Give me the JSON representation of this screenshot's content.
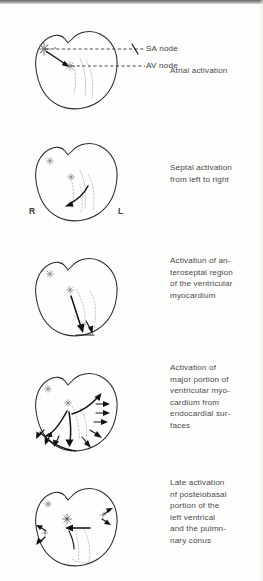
{
  "figure": {
    "ink_color": "#111111",
    "faint_color": "#b9b4aa",
    "page_color": "#fdfdfc"
  },
  "panels": [
    {
      "id": "panel-1",
      "caption_lines": [
        "Atrial activation"
      ],
      "annotations": [
        {
          "name": "sa-node-label",
          "text": "SA node"
        },
        {
          "name": "av-node-label",
          "text": "AV node"
        }
      ],
      "side_labels": []
    },
    {
      "id": "panel-2",
      "caption_lines": [
        "Septal activation",
        "from left to right"
      ],
      "annotations": [],
      "side_labels": [
        {
          "name": "right-side-label",
          "text": "R"
        },
        {
          "name": "left-side-label",
          "text": "L"
        }
      ]
    },
    {
      "id": "panel-3",
      "caption_lines": [
        "Activatiun of an-",
        "teroseptal region",
        "of the ventricular",
        "myocardium"
      ],
      "annotations": [],
      "side_labels": []
    },
    {
      "id": "panel-4",
      "caption_lines": [
        "Activation of",
        "major portion of",
        "ventricular myo-",
        "cardium from",
        "endocardial sur-",
        "faces"
      ],
      "annotations": [],
      "side_labels": []
    },
    {
      "id": "panel-5",
      "caption_lines": [
        "Late activation",
        "nf posteiobasal",
        "portion of the",
        "left ventrical",
        "and the pulmn-",
        "nary conus"
      ],
      "annotations": [],
      "side_labels": []
    }
  ]
}
